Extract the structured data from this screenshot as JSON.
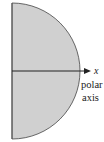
{
  "diagram": {
    "shape": "half-disk",
    "fill_color": "#d0d0d0",
    "stroke_color": "#444444",
    "axis_label": "x",
    "axis_caption_line1": "polar",
    "axis_caption_line2": "axis"
  }
}
